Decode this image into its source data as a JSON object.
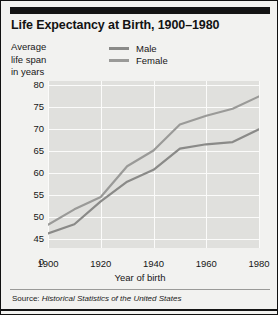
{
  "title": "Life Expectancy at Birth, 1900–1980",
  "axis_caption_lines": [
    "Average",
    "life span",
    "in years"
  ],
  "legend": [
    {
      "label": "Male",
      "color": "#8a8a88",
      "icon": "line-swatch-icon"
    },
    {
      "label": "Female",
      "color": "#9a9a98",
      "icon": "line-swatch-icon"
    }
  ],
  "xaxis_title": "Year of birth",
  "source": {
    "prefix": "Source: ",
    "work": "Historical Statistics of the United States"
  },
  "colors": {
    "page_background": "#f2f2f0",
    "plot_background": "#e0e0dd",
    "gridline": "#fbfbfa",
    "rule": "#141414",
    "text": "#161616",
    "male_line": "#8a8a88",
    "female_line": "#9a9a98"
  },
  "chart_data": {
    "type": "line",
    "title": "Life Expectancy at Birth, 1900–1980",
    "xlabel": "Year of birth",
    "ylabel": "Average life span in years",
    "xlim": [
      1900,
      1980
    ],
    "ylim": [
      43,
      81
    ],
    "grid": true,
    "legend_position": "top-center",
    "xticks": [
      1900,
      1920,
      1940,
      1960,
      1980
    ],
    "yticks": [
      0,
      45,
      50,
      55,
      60,
      65,
      70,
      75,
      80
    ],
    "ytick_labels": [
      "0",
      "45",
      "50",
      "55",
      "60",
      "65",
      "70",
      "75",
      "80"
    ],
    "y_axis_note": "axis is broken between 0 and 45",
    "x": [
      1900,
      1910,
      1920,
      1930,
      1940,
      1950,
      1960,
      1970,
      1980
    ],
    "series": [
      {
        "name": "Male",
        "color": "#8a8a88",
        "values": [
          46.3,
          48.4,
          53.6,
          58.1,
          60.8,
          65.6,
          66.6,
          67.1,
          70.0
        ]
      },
      {
        "name": "Female",
        "color": "#9a9a98",
        "values": [
          48.3,
          51.8,
          54.6,
          61.6,
          65.2,
          71.1,
          73.1,
          74.7,
          77.5
        ]
      }
    ]
  }
}
